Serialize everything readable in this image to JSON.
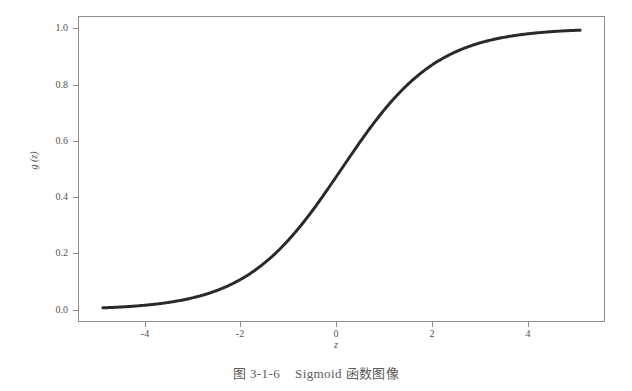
{
  "caption": {
    "figure_number": "图 3-1-6",
    "title": "Sigmoid 函数图像",
    "full": "图 3-1-6　Sigmoid 函数图像"
  },
  "chart_data": {
    "type": "line",
    "title": "",
    "xlabel": "z",
    "ylabel": "g (z)",
    "xlim": [
      -5.5,
      5.5
    ],
    "ylim": [
      -0.04,
      1.04
    ],
    "grid": false,
    "legend": false,
    "frame": true,
    "line_color": "#2a2a2a",
    "line_width": 3,
    "xticks": [
      -4,
      -2,
      0,
      2,
      4
    ],
    "xticklabels": [
      "-4",
      "-2",
      "0",
      "2",
      "4"
    ],
    "yticks": [
      0.0,
      0.2,
      0.4,
      0.6,
      0.8,
      1.0
    ],
    "yticklabels": [
      "0.0",
      "0.2",
      "0.4",
      "0.6",
      "0.8",
      "1.0"
    ],
    "series": [
      {
        "name": "sigmoid",
        "formula": "g(z) = 1 / (1 + e^(-z))",
        "x": [
          -5,
          -4.75,
          -4.5,
          -4.25,
          -4,
          -3.75,
          -3.5,
          -3.25,
          -3,
          -2.75,
          -2.5,
          -2.25,
          -2,
          -1.75,
          -1.5,
          -1.25,
          -1,
          -0.75,
          -0.5,
          -0.25,
          0,
          0.25,
          0.5,
          0.75,
          1,
          1.25,
          1.5,
          1.75,
          2,
          2.25,
          2.5,
          2.75,
          3,
          3.25,
          3.5,
          3.75,
          4,
          4.25,
          4.5,
          4.75,
          5
        ],
        "y": [
          0.007,
          0.009,
          0.011,
          0.014,
          0.018,
          0.023,
          0.029,
          0.037,
          0.047,
          0.06,
          0.076,
          0.095,
          0.119,
          0.148,
          0.182,
          0.223,
          0.269,
          0.321,
          0.378,
          0.438,
          0.5,
          0.562,
          0.622,
          0.679,
          0.731,
          0.777,
          0.818,
          0.852,
          0.881,
          0.905,
          0.924,
          0.94,
          0.953,
          0.963,
          0.971,
          0.977,
          0.982,
          0.986,
          0.989,
          0.991,
          0.993
        ]
      }
    ]
  }
}
